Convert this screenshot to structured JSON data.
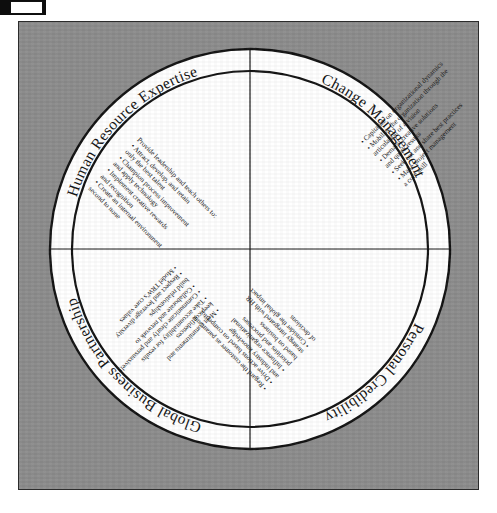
{
  "figure": {
    "background_color": "#8b8b8b",
    "circle_fill": "#ffffff",
    "line_color": "#111111"
  },
  "quadrants": [
    {
      "id": "human-resource-expertise",
      "title": "Human Resource Expertise",
      "position": "top-left",
      "bullets": [
        "Provide leadership and teach others to:",
        "Attract, develop, and retain only the best talent",
        "Champion process improvement and apply technology",
        "Implement creative rewards and recognition",
        "Create an internal environment second to none"
      ]
    },
    {
      "id": "change-management",
      "title": "Change Management",
      "position": "top-right",
      "bullets": [
        "Capitalize on organizational dynamics",
        "Mobilize the organization through the articulation of a vision",
        "Demand creative solutions and quick results",
        "Seek out and share best practices",
        "Make project management a core skill"
      ]
    },
    {
      "id": "global-business-partnership",
      "title": "Global Business Partnership",
      "position": "bottom-left",
      "bullets": [
        "Regard the customer as paramount",
        "Drive actions based on competitor and industry knowledge",
        "Influence organizational priorities and processes based on business strategy integrated with HR",
        "Consider the global impact of decisions"
      ]
    },
    {
      "id": "personal-credibility",
      "title": "Personal Credibility",
      "position": "bottom-right",
      "bullets": [
        "Meet commitments and keep confidences",
        "Take accountability for results",
        "Communicate clearly and persuasively",
        "Collaborate and network to build relationships",
        "Respect and leverage diversity",
        "Model TRW's core values"
      ]
    }
  ],
  "bullet_lines": {
    "hr": [
      "Provide leadership and teach others to:",
      "• Attract, develop, and retain",
      "only the best talent",
      "• Champion process improvement",
      "and apply technology",
      "• Implement creative rewards",
      "and recognition",
      "• Create an internal environment",
      "second to none"
    ],
    "cm": [
      "• Capitalize on organizational dynamics",
      "• Mobilize the organization through the",
      "articulation of a vision",
      "• Demand creative solutions",
      "and quick results",
      "• Seek out and share best practices",
      "• Make project management",
      "a core skill"
    ],
    "gb": [
      "• Regard the customer as paramount",
      "• Drive actions based on competitor",
      "and industry knowledge",
      "• Influence organizational",
      "priorities and processes",
      "based on business",
      "strategy integrated with HR",
      "• Consider the global impact",
      "of decisions"
    ],
    "pc": [
      "• Meet commitments and",
      "keep confidences",
      "• Take accountability for results",
      "• Communicate clearly and persuasively",
      "• Collaborate and network to",
      "build relationships",
      "• Respect and leverage diversity",
      "• Model TRW's core values"
    ]
  }
}
